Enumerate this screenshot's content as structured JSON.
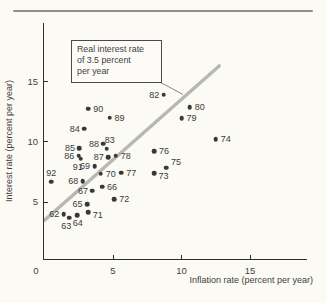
{
  "chart_data": {
    "type": "scatter",
    "title": "",
    "xlabel": "Inflation rate (percent per year)",
    "ylabel": "Interest rate (percent per year)",
    "xlim": [
      0,
      19.2
    ],
    "ylim": [
      0,
      19.8
    ],
    "grid": false,
    "x_ticks": [
      {
        "value": 0,
        "label": "0"
      },
      {
        "value": 5,
        "label": "5"
      },
      {
        "value": 10,
        "label": "10"
      },
      {
        "value": 15,
        "label": "15"
      }
    ],
    "y_ticks": [
      {
        "value": 5,
        "label": "5"
      },
      {
        "value": 10,
        "label": "10"
      },
      {
        "value": 15,
        "label": "15"
      }
    ],
    "dot_color": "#383838",
    "points": [
      {
        "year": "62",
        "x": 1.4,
        "y": 4.0,
        "label_side": "left"
      },
      {
        "year": "63",
        "x": 1.8,
        "y": 3.7,
        "label_side": "below-left"
      },
      {
        "year": "64",
        "x": 2.4,
        "y": 3.9,
        "label_side": "below"
      },
      {
        "year": "65",
        "x": 3.1,
        "y": 4.85,
        "label_side": "left"
      },
      {
        "year": "66",
        "x": 4.2,
        "y": 6.3,
        "label_side": "right"
      },
      {
        "year": "67",
        "x": 3.5,
        "y": 5.95,
        "label_side": "left"
      },
      {
        "year": "68",
        "x": 2.8,
        "y": 6.75,
        "label_side": "left"
      },
      {
        "year": "69",
        "x": 3.65,
        "y": 8.0,
        "label_side": "left"
      },
      {
        "year": "70",
        "x": 4.1,
        "y": 7.35,
        "label_side": "right"
      },
      {
        "year": "71",
        "x": 3.2,
        "y": 4.15,
        "label_side": "right-below"
      },
      {
        "year": "72",
        "x": 5.1,
        "y": 5.25,
        "label_side": "right"
      },
      {
        "year": "73",
        "x": 8.0,
        "y": 7.4,
        "label_side": "right-below"
      },
      {
        "year": "74",
        "x": 12.5,
        "y": 10.2,
        "label_side": "right"
      },
      {
        "year": "75",
        "x": 8.9,
        "y": 7.85,
        "label_side": "right-above"
      },
      {
        "year": "76",
        "x": 8.0,
        "y": 9.25,
        "label_side": "right"
      },
      {
        "year": "77",
        "x": 5.6,
        "y": 7.45,
        "label_side": "right"
      },
      {
        "year": "78",
        "x": 5.2,
        "y": 8.85,
        "label_side": "right"
      },
      {
        "year": "79",
        "x": 10.0,
        "y": 11.95,
        "label_side": "right"
      },
      {
        "year": "80",
        "x": 10.6,
        "y": 12.9,
        "label_side": "right"
      },
      {
        "year": "82",
        "x": 8.7,
        "y": 13.9,
        "label_side": "left"
      },
      {
        "year": "83",
        "x": 4.55,
        "y": 9.45,
        "label_side": "above-right"
      },
      {
        "year": "84",
        "x": 2.9,
        "y": 11.1,
        "label_side": "left"
      },
      {
        "year": "85",
        "x": 2.55,
        "y": 9.5,
        "label_side": "left"
      },
      {
        "year": "86",
        "x": 2.5,
        "y": 8.85,
        "label_side": "left"
      },
      {
        "year": "87",
        "x": 4.65,
        "y": 8.75,
        "label_side": "left"
      },
      {
        "year": "88",
        "x": 4.3,
        "y": 9.85,
        "label_side": "left"
      },
      {
        "year": "89",
        "x": 4.75,
        "y": 12.0,
        "label_side": "right"
      },
      {
        "year": "90",
        "x": 3.2,
        "y": 12.75,
        "label_side": "right"
      },
      {
        "year": "91",
        "x": 2.65,
        "y": 8.6,
        "label_side": "below-left"
      },
      {
        "year": "92",
        "x": 0.5,
        "y": 6.7,
        "label_side": "above"
      }
    ],
    "reference_line": {
      "name": "real-interest-rate-line",
      "x1": 0,
      "y1": 3.5,
      "x2": 12.75,
      "y2": 16.3,
      "color": "#b7b7b4"
    },
    "annotation": {
      "lines": [
        "Real interest rate",
        "of 3.5 percent",
        "per year"
      ]
    }
  }
}
